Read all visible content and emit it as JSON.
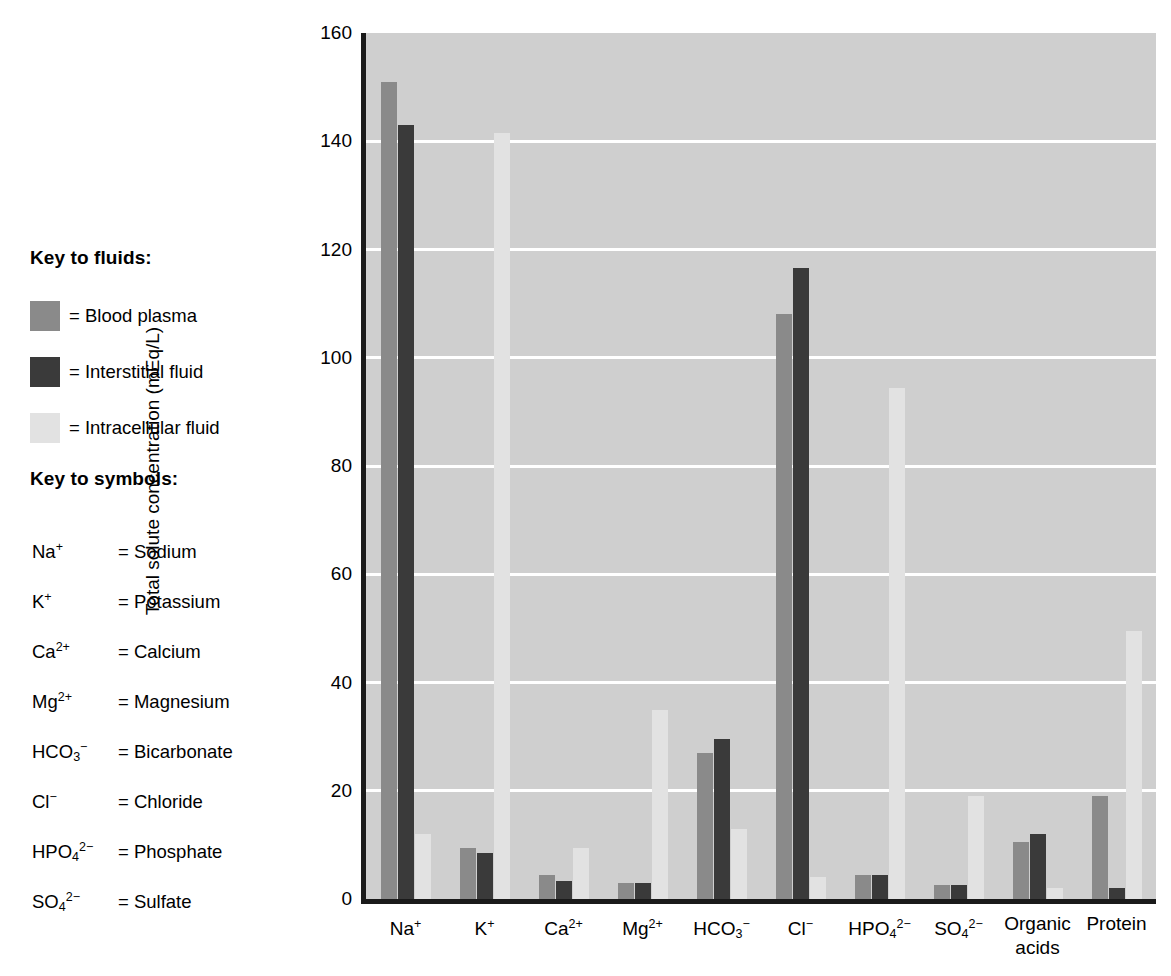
{
  "fluid_key": {
    "heading": "Key to fluids:",
    "items": [
      {
        "label": "= Blood plasma",
        "color": "#8a8a8a",
        "series": "Blood plasma"
      },
      {
        "label": "= Interstitial fluid",
        "color": "#3a3a3a",
        "series": "Interstitial fluid"
      },
      {
        "label": "= Intracellular fluid",
        "color": "#e2e2e2",
        "series": "Intracellular fluid"
      }
    ]
  },
  "symbol_key": {
    "heading": "Key to symbols:",
    "items": [
      {
        "formula_html": "Na<sup>+</sup>",
        "plain": "Na+",
        "name": "= Sodium"
      },
      {
        "formula_html": "K<sup>+</sup>",
        "plain": "K+",
        "name": "= Potassium"
      },
      {
        "formula_html": "Ca<sup>2+</sup>",
        "plain": "Ca2+",
        "name": "= Calcium"
      },
      {
        "formula_html": "Mg<sup>2+</sup>",
        "plain": "Mg2+",
        "name": "= Magnesium"
      },
      {
        "formula_html": "HCO<sub>3</sub><sup>−</sup>",
        "plain": "HCO3-",
        "name": "= Bicarbonate"
      },
      {
        "formula_html": "Cl<sup>−</sup>",
        "plain": "Cl-",
        "name": "= Chloride"
      },
      {
        "formula_html": "HPO<sub>4</sub><sup>2−</sup>",
        "plain": "HPO42-",
        "name": "= Phosphate"
      },
      {
        "formula_html": "SO<sub>4</sub><sup>2−</sup>",
        "plain": "SO42-",
        "name": "= Sulfate"
      }
    ]
  },
  "chart_data": {
    "type": "bar",
    "title": "",
    "xlabel": "",
    "ylabel": "Total solute concentration (mEq/L)",
    "ylim": [
      0,
      160
    ],
    "yticks": [
      0,
      20,
      40,
      60,
      80,
      100,
      120,
      140,
      160
    ],
    "ytick_labels": [
      "0",
      "20",
      "40",
      "60",
      "80",
      "100",
      "120",
      "140",
      "160"
    ],
    "grid": true,
    "legend_position": "left-outside",
    "categories": [
      "Na+",
      "K+",
      "Ca2+",
      "Mg2+",
      "HCO3-",
      "Cl-",
      "HPO42-",
      "SO42-",
      "Organic acids",
      "Protein"
    ],
    "category_labels_html": [
      "Na<sup>+</sup>",
      "K<sup>+</sup>",
      "Ca<sup>2+</sup>",
      "Mg<sup>2+</sup>",
      "HCO<sub>3</sub><sup>−</sup>",
      "Cl<sup>−</sup>",
      "HPO<sub>4</sub><sup>2−</sup>",
      "SO<sub>4</sub><sup>2−</sup>",
      "Organic<br>acids",
      "Protein"
    ],
    "series": [
      {
        "name": "Blood plasma",
        "color": "#8a8a8a",
        "values": [
          151,
          9.5,
          4.5,
          3,
          27,
          108,
          4.5,
          2.5,
          10.5,
          19
        ]
      },
      {
        "name": "Interstitial fluid",
        "color": "#3a3a3a",
        "values": [
          143,
          8.5,
          3.3,
          3,
          29.5,
          116.5,
          4.5,
          2.5,
          12,
          2
        ]
      },
      {
        "name": "Intracellular fluid",
        "color": "#e2e2e2",
        "values": [
          12,
          141.5,
          9.5,
          35,
          13,
          4,
          94.5,
          19,
          2,
          49.5
        ]
      }
    ]
  }
}
